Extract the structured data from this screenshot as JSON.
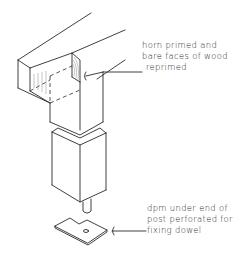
{
  "diagram": {
    "type": "technical-sketch",
    "colors": {
      "line": "#2a2a2a",
      "background": "#ffffff"
    }
  },
  "annotations": {
    "horn": {
      "lines": [
        "horn primed and",
        "bare faces of wood",
        "reprimed"
      ]
    },
    "dpm": {
      "lines": [
        "dpm under end of",
        "post perforated for",
        "fixing dowel"
      ]
    }
  }
}
